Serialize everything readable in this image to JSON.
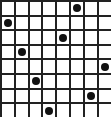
{
  "puzzle": {
    "type": "eight-queens",
    "rows": 8,
    "cols": 8,
    "grid_color": "#222222",
    "dot_color": "#111111",
    "background": "#ffffff",
    "queens": [
      {
        "row": 0,
        "col": 5
      },
      {
        "row": 1,
        "col": 0
      },
      {
        "row": 2,
        "col": 4
      },
      {
        "row": 3,
        "col": 1
      },
      {
        "row": 4,
        "col": 7
      },
      {
        "row": 5,
        "col": 2
      },
      {
        "row": 6,
        "col": 6
      },
      {
        "row": 7,
        "col": 3
      }
    ]
  }
}
